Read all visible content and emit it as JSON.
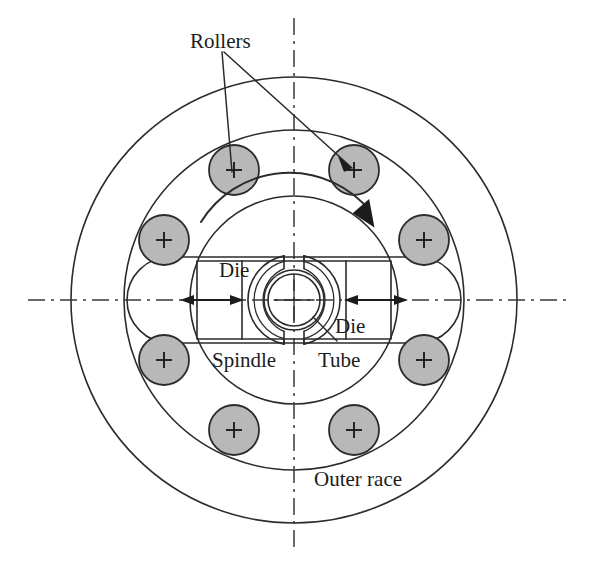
{
  "figure": {
    "kind": "engineering-cross-section-diagram",
    "width": 592,
    "height": 575,
    "background_color": "#ffffff",
    "line_color": "#2b2b2b",
    "roller_fill_color": "#b8b8b8"
  },
  "labels": {
    "rollers": "Rollers",
    "die_left": "Die",
    "die_right": "Die",
    "spindle": "Spindle",
    "tube": "Tube",
    "outer_race": "Outer race"
  },
  "geometry": {
    "center": {
      "x": 294,
      "y": 300
    },
    "outer_race_outer_radius": 223,
    "outer_race_inner_radius": 170,
    "cage_radius": 104,
    "roller_radius": 25,
    "roller_orbit_radius": 143,
    "roller_count": 8,
    "roller_angles_deg": [
      25,
      65,
      115,
      155,
      205,
      245,
      295,
      335
    ],
    "spindle_half_width": 124,
    "spindle_half_height": 43,
    "die_box_half_width": 97,
    "die_box_half_height": 39,
    "tube_outer_radius": 45,
    "tube_radii": [
      45,
      40,
      34,
      30,
      26
    ],
    "rotation_direction": "clockwise"
  },
  "annotations": {
    "rollers_leader_targets": [
      {
        "x": 232,
        "y": 170
      },
      {
        "x": 352,
        "y": 168
      }
    ],
    "rollers_label_anchor": {
      "x": 243,
      "y": 43
    },
    "tube_leader_from": {
      "x": 337,
      "y": 340
    },
    "tube_leader_to": {
      "x": 316,
      "y": 318
    },
    "die_arrow_direction": "bidirectional-horizontal",
    "outer_race_label_anchor": {
      "x": 314,
      "y": 481
    }
  },
  "centerlines": {
    "horizontal": {
      "y": 300,
      "x_start": 28,
      "x_end": 566
    },
    "vertical": {
      "x": 294,
      "y_start": 18,
      "y_end": 552
    },
    "style": "dash-dot"
  }
}
